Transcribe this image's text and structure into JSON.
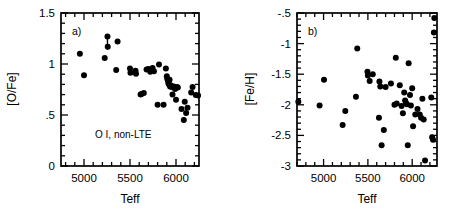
{
  "figure": {
    "title": "",
    "background": "#ffffff",
    "marker_color": "#000000"
  },
  "chart_data": [
    {
      "type": "scatter",
      "panel": "a",
      "panel_label": "a)",
      "title": "",
      "xlabel": "Teff",
      "ylabel": "[O/Fe]",
      "xlim": [
        4750,
        6250
      ],
      "ylim": [
        0,
        1.5
      ],
      "xticks": [
        5000,
        5500,
        6000
      ],
      "xtick_labels": [
        "5000",
        "5500",
        "6000"
      ],
      "xticks_minor_step": 100,
      "yticks": [
        0,
        0.5,
        1,
        1.5
      ],
      "ytick_labels": [
        "0",
        ".5",
        "1",
        "1.5"
      ],
      "yticks_minor_step": 0.1,
      "grid": false,
      "legend": null,
      "annotations": [
        {
          "text": "O I, non-LTE",
          "x": 5120,
          "y": 0.27
        }
      ],
      "series": [
        {
          "name": "O I non-LTE abundances",
          "marker": "filled-circle",
          "color": "#000000",
          "x": [
            4955,
            5000,
            5225,
            5255,
            5258,
            5350,
            5365,
            5500,
            5505,
            5560,
            5565,
            5615,
            5625,
            5650,
            5680,
            5700,
            5720,
            5745,
            5760,
            5800,
            5815,
            5865,
            5890,
            5900,
            5905,
            5912,
            5918,
            5925,
            5930,
            5935,
            5945,
            5955,
            5962,
            5975,
            5990,
            6000,
            6010,
            6020,
            6060,
            6085,
            6095,
            6110,
            6125,
            6165,
            6180,
            6215,
            6240
          ],
          "y": [
            1.1,
            0.89,
            1.06,
            1.27,
            1.17,
            0.94,
            1.22,
            0.955,
            0.915,
            0.935,
            0.905,
            0.7,
            0.705,
            0.715,
            0.945,
            0.95,
            0.925,
            0.96,
            0.93,
            0.6,
            0.995,
            0.6,
            0.955,
            0.88,
            0.855,
            0.835,
            0.81,
            0.8,
            0.845,
            0.78,
            0.79,
            0.775,
            0.7,
            0.78,
            0.755,
            0.65,
            0.775,
            0.77,
            0.56,
            0.45,
            0.63,
            0.52,
            0.57,
            0.72,
            0.775,
            0.695,
            0.69
          ]
        }
      ],
      "error_indicators": [
        {
          "type": "upper-limit-arrow",
          "x": 5255,
          "y_from": 1.27,
          "y_to": 1.15,
          "direction": "down"
        }
      ]
    },
    {
      "type": "scatter",
      "panel": "b",
      "panel_label": "b)",
      "title": "",
      "xlabel": "Teff",
      "ylabel": "[Fe/H]",
      "xlim": [
        4700,
        6280
      ],
      "ylim": [
        -3.0,
        -0.5
      ],
      "xticks": [
        5000,
        5500,
        6000
      ],
      "xtick_labels": [
        "5000",
        "5500",
        "6000"
      ],
      "xticks_minor_step": 100,
      "yticks": [
        -3.0,
        -2.5,
        -2.0,
        -1.5,
        -1.0,
        -0.5
      ],
      "ytick_labels": [
        "-3",
        "-2.5",
        "-2",
        "-1.5",
        "-1",
        "-.5"
      ],
      "yticks_minor_step": 0.1,
      "grid": false,
      "legend": null,
      "annotations": [],
      "series": [
        {
          "name": "Metallicity [Fe/H]",
          "marker": "filled-circle",
          "color": "#000000",
          "x": [
            4715,
            4955,
            5005,
            5215,
            5245,
            5365,
            5380,
            5495,
            5500,
            5520,
            5555,
            5625,
            5630,
            5640,
            5655,
            5680,
            5700,
            5760,
            5800,
            5815,
            5825,
            5860,
            5880,
            5895,
            5910,
            5920,
            5930,
            5940,
            5950,
            5960,
            5975,
            5985,
            6000,
            6010,
            6035,
            6060,
            6085,
            6100,
            6115,
            6130,
            6145,
            6215,
            6225,
            6235,
            6245,
            6250
          ],
          "y": [
            -1.95,
            -2.01,
            -1.59,
            -2.33,
            -2.1,
            -1.87,
            -1.08,
            -1.46,
            -1.52,
            -1.61,
            -1.5,
            -2.21,
            -1.62,
            -1.7,
            -2.66,
            -2.41,
            -1.71,
            -1.65,
            -2.0,
            -1.23,
            -1.98,
            -1.68,
            -2.02,
            -2.14,
            -1.8,
            -1.93,
            -1.97,
            -1.99,
            -2.66,
            -1.32,
            -1.84,
            -2.01,
            -1.73,
            -2.35,
            -2.16,
            -2.07,
            -2.16,
            -2.21,
            -1.9,
            -2.24,
            -2.91,
            -1.88,
            -2.53,
            -2.57,
            -0.82,
            -0.58
          ]
        }
      ],
      "error_indicators": []
    }
  ]
}
